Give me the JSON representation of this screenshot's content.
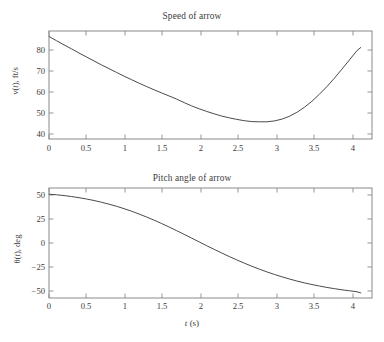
{
  "figure": {
    "background_color": "#ffffff",
    "frame_color": "#8a8a8a",
    "curve_color": "#4a4a4a",
    "text_color": "#3c3c3c"
  },
  "panels": [
    {
      "id": "speed",
      "title": "Speed of arrow",
      "ylabel_pre": "v(",
      "ylabel_it": "t",
      "ylabel_post": "), ft/s",
      "ylabel_plain": "v(t), ft/s",
      "yticks": [
        "80",
        "70",
        "60",
        "50",
        "40"
      ],
      "xticks": [
        "0",
        "0.5",
        "1",
        "1.5",
        "2",
        "2.5",
        "3",
        "3.5",
        "4"
      ],
      "xaxis_title": ""
    },
    {
      "id": "pitch",
      "title": "Pitch angle of arrow",
      "ylabel_pre": "θ(",
      "ylabel_it": "t",
      "ylabel_post": "), deg",
      "ylabel_plain": "θ(t), deg",
      "yticks": [
        "50",
        "25",
        "0",
        "−25",
        "−50"
      ],
      "xticks": [
        "0",
        "0.5",
        "1",
        "1.5",
        "2",
        "2.5",
        "3",
        "3.5",
        "4"
      ],
      "xaxis_title_pre": "",
      "xaxis_title_it": "t",
      "xaxis_title_post": " (s)",
      "xaxis_title_plain": "t (s)"
    }
  ],
  "chart_data": [
    {
      "type": "line",
      "id": "speed-of-arrow",
      "title": "Speed of arrow",
      "xlabel": "",
      "ylabel": "v(t), ft/s",
      "xlim": [
        0,
        4.3
      ],
      "ylim": [
        37.5,
        86.5
      ],
      "xticks": [
        0,
        0.5,
        1,
        1.5,
        2,
        2.5,
        3,
        3.5,
        4
      ],
      "yticks": [
        40,
        50,
        60,
        70,
        80
      ],
      "grid": false,
      "legend": false,
      "series": [
        {
          "name": "v(t)",
          "x": [
            0.0,
            0.1,
            0.2,
            0.3,
            0.4,
            0.5,
            0.6,
            0.7,
            0.8,
            0.9,
            1.0,
            1.1,
            1.2,
            1.3,
            1.4,
            1.5,
            1.6,
            1.7,
            1.8,
            1.9,
            2.0,
            2.1,
            2.2,
            2.3,
            2.4,
            2.5,
            2.6,
            2.7,
            2.8,
            2.9,
            3.0,
            3.1,
            3.2,
            3.3,
            3.4,
            3.5,
            3.6,
            3.7,
            3.8,
            3.9,
            4.0,
            4.1,
            4.15
          ],
          "values": [
            84.0,
            82.1,
            80.2,
            78.4,
            76.5,
            74.7,
            72.9,
            71.1,
            69.4,
            67.7,
            66.0,
            64.4,
            62.8,
            61.3,
            59.8,
            58.4,
            57.0,
            55.6,
            54.0,
            52.5,
            51.2,
            50.0,
            48.9,
            47.9,
            47.1,
            46.4,
            45.8,
            45.4,
            45.3,
            45.3,
            45.7,
            46.5,
            47.8,
            49.6,
            51.9,
            54.6,
            57.8,
            61.3,
            65.1,
            69.2,
            73.4,
            77.6,
            79.0
          ]
        }
      ]
    },
    {
      "type": "line",
      "id": "pitch-angle-of-arrow",
      "title": "Pitch angle of arrow",
      "xlabel": "t (s)",
      "ylabel": "θ(t), deg",
      "xlim": [
        0,
        4.3
      ],
      "ylim": [
        -63,
        62
      ],
      "xticks": [
        0,
        0.5,
        1,
        1.5,
        2,
        2.5,
        3,
        3.5,
        4
      ],
      "yticks": [
        -50,
        -25,
        0,
        25,
        50
      ],
      "grid": false,
      "legend": false,
      "series": [
        {
          "name": "θ(t)",
          "x": [
            0.0,
            0.1,
            0.2,
            0.3,
            0.4,
            0.5,
            0.6,
            0.7,
            0.8,
            0.9,
            1.0,
            1.1,
            1.2,
            1.3,
            1.4,
            1.5,
            1.6,
            1.7,
            1.8,
            1.9,
            2.0,
            2.1,
            2.2,
            2.3,
            2.4,
            2.5,
            2.6,
            2.7,
            2.8,
            2.9,
            3.0,
            3.1,
            3.2,
            3.3,
            3.4,
            3.5,
            3.6,
            3.7,
            3.8,
            3.9,
            4.0,
            4.1,
            4.15
          ],
          "values": [
            55.0,
            54.3,
            53.4,
            52.3,
            51.0,
            49.5,
            47.8,
            45.8,
            43.6,
            41.2,
            38.5,
            35.6,
            32.4,
            29.0,
            25.4,
            21.6,
            17.6,
            13.5,
            9.3,
            5.0,
            0.7,
            -3.6,
            -7.8,
            -11.9,
            -15.9,
            -19.7,
            -23.4,
            -26.9,
            -30.2,
            -33.3,
            -36.2,
            -38.9,
            -41.4,
            -43.7,
            -45.8,
            -47.7,
            -49.4,
            -51.0,
            -52.4,
            -53.7,
            -54.8,
            -55.9,
            -57.2
          ]
        }
      ]
    }
  ]
}
